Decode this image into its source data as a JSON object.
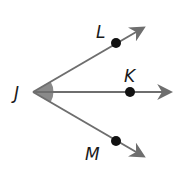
{
  "diagram": {
    "vertex": {
      "label": "J"
    },
    "points": [
      {
        "label": "L",
        "ray": "JL"
      },
      {
        "label": "K",
        "ray": "JK"
      },
      {
        "label": "M",
        "ray": "JM"
      }
    ],
    "shaded_angle": "LJM",
    "colors": {
      "ray": "#6e6e6e",
      "point": "#111111",
      "shade": "#8a8a8a",
      "text": "#1a1a1a"
    }
  }
}
